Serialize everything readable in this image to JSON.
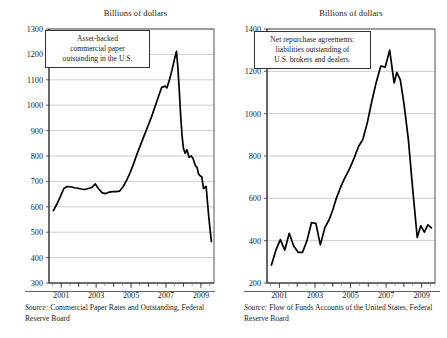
{
  "figure": {
    "panels": [
      {
        "id": "asset-backed-commercial-paper",
        "title": "Billions of dollars",
        "annotation": [
          "Asset-backed",
          "commercial paper",
          "outstanding in the U.S."
        ],
        "source_label": "Source:",
        "source_text": " Commercial Paper Rates and Outstanding, Federal Reserve Board",
        "chart_data": {
          "type": "line",
          "title": "Billions of dollars",
          "xlabel": "",
          "ylabel": "Billions of dollars",
          "xlim": [
            2000.3,
            2009.75
          ],
          "ylim": [
            300,
            1300
          ],
          "yticks": [
            300,
            400,
            500,
            600,
            700,
            800,
            900,
            1000,
            1100,
            1200,
            1300
          ],
          "xticks": [
            2001,
            2003,
            2005,
            2007,
            2009
          ],
          "xticks_minor": [
            2002,
            2004,
            2006,
            2008
          ],
          "grid": true,
          "legend": "none",
          "series": [
            {
              "name": "Asset-backed commercial paper outstanding",
              "x": [
                2000.55,
                2000.75,
                2000.95,
                2001.15,
                2001.35,
                2001.55,
                2001.75,
                2001.95,
                2002.15,
                2002.35,
                2002.55,
                2002.75,
                2002.95,
                2003.15,
                2003.35,
                2003.55,
                2003.75,
                2003.95,
                2004.15,
                2004.35,
                2004.55,
                2004.75,
                2004.95,
                2005.15,
                2005.35,
                2005.55,
                2005.75,
                2005.95,
                2006.15,
                2006.35,
                2006.55,
                2006.75,
                2006.95,
                2007.05,
                2007.2,
                2007.35,
                2007.5,
                2007.6,
                2007.68,
                2007.76,
                2007.84,
                2007.92,
                2008.0,
                2008.1,
                2008.2,
                2008.32,
                2008.45,
                2008.55,
                2008.62,
                2008.7,
                2008.78,
                2008.86,
                2008.95,
                2009.05,
                2009.15,
                2009.3,
                2009.45,
                2009.6
              ],
              "y": [
                585,
                610,
                640,
                672,
                680,
                679,
                675,
                673,
                670,
                668,
                672,
                676,
                690,
                670,
                655,
                652,
                658,
                660,
                660,
                662,
                680,
                705,
                735,
                770,
                810,
                845,
                880,
                915,
                950,
                990,
                1030,
                1070,
                1075,
                1068,
                1100,
                1140,
                1185,
                1212,
                1150,
                1060,
                960,
                880,
                830,
                810,
                825,
                795,
                800,
                790,
                775,
                760,
                755,
                730,
                722,
                718,
                672,
                680,
                560,
                463
              ]
            }
          ]
        }
      },
      {
        "id": "net-repurchase-agreements",
        "title": "Billions of dollars",
        "annotation": [
          "Net repurchase agreements:",
          "liabilities outstanding of",
          "U.S. brokers and dealers."
        ],
        "source_label": "Source:",
        "source_text": " Flow of Funds Accounts of the United States, Federal Reserve Board",
        "chart_data": {
          "type": "line",
          "title": "Billions of dollars",
          "xlabel": "",
          "ylabel": "Billions of dollars",
          "xlim": [
            2000.3,
            2009.75
          ],
          "ylim": [
            200,
            1400
          ],
          "yticks": [
            200,
            400,
            600,
            800,
            1000,
            1200,
            1400
          ],
          "xticks": [
            2001,
            2003,
            2005,
            2007,
            2009
          ],
          "xticks_minor": [
            2002,
            2004,
            2006,
            2008
          ],
          "grid": true,
          "legend": "none",
          "series": [
            {
              "name": "Net repurchase agreements: liabilities outstanding of U.S. brokers and dealers",
              "x": [
                2000.55,
                2000.8,
                2001.05,
                2001.3,
                2001.55,
                2001.8,
                2002.05,
                2002.3,
                2002.55,
                2002.8,
                2003.05,
                2003.3,
                2003.55,
                2003.8,
                2004.0,
                2004.2,
                2004.45,
                2004.7,
                2004.95,
                2005.2,
                2005.45,
                2005.7,
                2005.95,
                2006.2,
                2006.45,
                2006.7,
                2006.95,
                2007.2,
                2007.45,
                2007.6,
                2007.8,
                2008.0,
                2008.25,
                2008.5,
                2008.75,
                2008.95,
                2009.15,
                2009.35,
                2009.55
              ],
              "y": [
                285,
                355,
                405,
                355,
                435,
                375,
                345,
                345,
                400,
                485,
                482,
                380,
                460,
                500,
                545,
                600,
                655,
                700,
                740,
                790,
                845,
                880,
                960,
                1060,
                1150,
                1225,
                1220,
                1300,
                1145,
                1195,
                1160,
                1050,
                880,
                640,
                415,
                470,
                440,
                475,
                460
              ]
            }
          ]
        }
      }
    ]
  }
}
